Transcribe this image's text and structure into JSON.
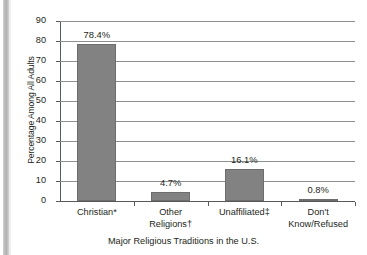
{
  "chart_data": {
    "type": "bar",
    "title": "",
    "xlabel": "Major Religious Traditions in the U.S.",
    "ylabel": "Percentage Among All Adults",
    "categories": [
      "Christian*",
      "Other\nReligions†",
      "Unaffiliated‡",
      "Don't\nKnow/Refused"
    ],
    "values": [
      78.4,
      4.7,
      16.1,
      0.8
    ],
    "value_labels": [
      "78.4%",
      "4.7%",
      "16.1%",
      "0.8%"
    ],
    "ylim": [
      0,
      90
    ],
    "yticks": [
      90,
      80,
      70,
      60,
      50,
      40,
      30,
      20,
      10,
      0
    ],
    "ytick_labels": [
      "90",
      "80",
      "70",
      "60",
      "50",
      "40",
      "30",
      "20",
      "10",
      "0"
    ],
    "grid": true,
    "legend": false,
    "bar_color": "#828282",
    "grid_color": "#8d8f91",
    "axis_color": "#58595b"
  }
}
